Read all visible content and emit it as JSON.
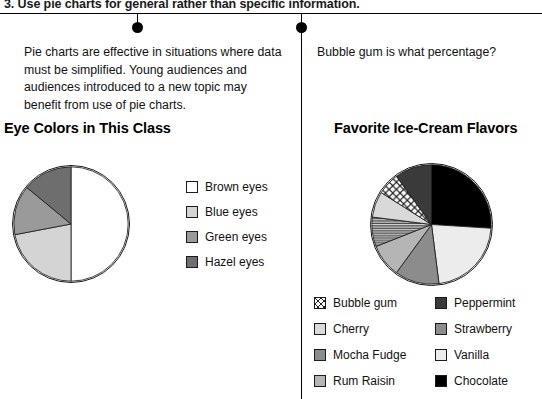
{
  "heading": "3.  Use pie charts for general rather than specific information.",
  "left_column": {
    "paragraph": "Pie charts are effective in situations where data must be simplified. Young audiences and audiences introduced to a new topic may benefit from use of pie charts.",
    "chart_title": "Eye Colors in This Class"
  },
  "right_column": {
    "paragraph": "Bubble gum is what percentage?",
    "chart_title": "Favorite Ice-Cream Flavors"
  },
  "chart_data": [
    {
      "type": "pie",
      "title": "Eye Colors in This Class",
      "categories": [
        "Brown eyes",
        "Blue eyes",
        "Green eyes",
        "Hazel eyes"
      ],
      "values": [
        50,
        22,
        14,
        14
      ],
      "colors": [
        "#ffffff",
        "#d4d4d4",
        "#9a9a9a",
        "#6e6e6e"
      ],
      "legend_position": "right",
      "start_angle": 0,
      "xlabel": "",
      "ylabel": ""
    },
    {
      "type": "pie",
      "title": "Favorite Ice-Cream Flavors",
      "categories": [
        "Chocolate",
        "Vanilla",
        "Strawberry",
        "Rum Raisin",
        "Mocha Fudge",
        "Cherry",
        "Bubble gum",
        "Peppermint"
      ],
      "values": [
        26,
        22,
        12,
        9,
        8,
        7,
        6,
        10
      ],
      "colors": [
        "#000000",
        "#ececec",
        "#8c8c8c",
        "#b5b5b5",
        "#7d7d7d",
        "#d9d9d9",
        "#ffffff",
        "#3a3a3a"
      ],
      "patterns": {
        "Bubble gum": "diagonal-cross-hatch",
        "Mocha Fudge": "horizontal-stripe"
      },
      "legend_position": "bottom",
      "start_angle": 0,
      "xlabel": "",
      "ylabel": ""
    }
  ],
  "legend_left": [
    {
      "label": "Brown eyes",
      "color": "#ffffff",
      "pattern": "solid"
    },
    {
      "label": "Blue eyes",
      "color": "#d4d4d4",
      "pattern": "solid"
    },
    {
      "label": "Green eyes",
      "color": "#9a9a9a",
      "pattern": "solid"
    },
    {
      "label": "Hazel eyes",
      "color": "#6e6e6e",
      "pattern": "solid"
    }
  ],
  "legend_right_col_a": [
    {
      "label": "Bubble gum",
      "color": "#ffffff",
      "pattern": "diagonal-cross-hatch"
    },
    {
      "label": "Cherry",
      "color": "#d9d9d9",
      "pattern": "solid"
    },
    {
      "label": "Mocha Fudge",
      "color": "#7d7d7d",
      "pattern": "horizontal-stripe"
    },
    {
      "label": "Rum Raisin",
      "color": "#b5b5b5",
      "pattern": "solid"
    }
  ],
  "legend_right_col_b": [
    {
      "label": "Peppermint",
      "color": "#3a3a3a",
      "pattern": "solid"
    },
    {
      "label": "Strawberry",
      "color": "#8c8c8c",
      "pattern": "solid"
    },
    {
      "label": "Vanilla",
      "color": "#ececec",
      "pattern": "solid"
    },
    {
      "label": "Chocolate",
      "color": "#000000",
      "pattern": "solid"
    }
  ]
}
